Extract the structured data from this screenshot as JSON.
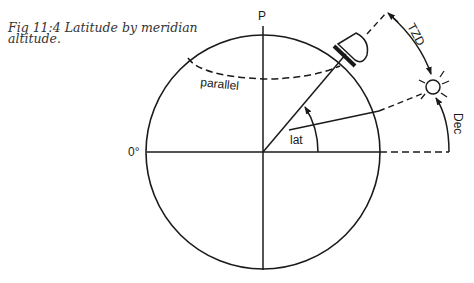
{
  "figure": {
    "caption_line1": "Fig 11:4 Latitude by meridian",
    "caption_line2": "altitude."
  },
  "labels": {
    "pole": "P",
    "equator": "0°",
    "parallel": "parallel",
    "latitude": "lat",
    "true_zenith_distance": "TZD",
    "declination": "Dec"
  },
  "colors": {
    "ink": "#1a1a1a",
    "background": "#ffffff"
  }
}
